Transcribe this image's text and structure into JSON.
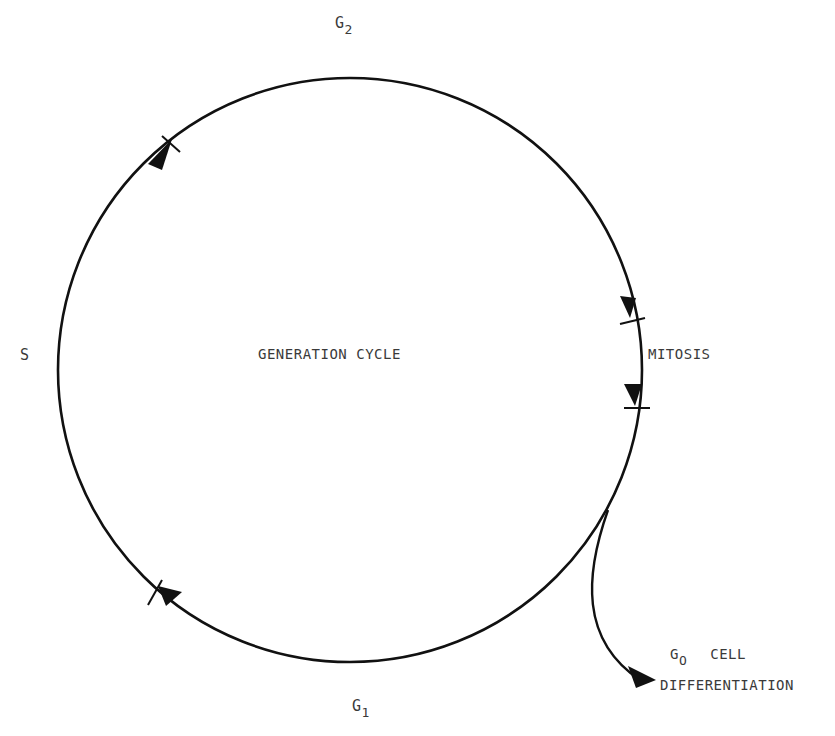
{
  "diagram": {
    "title": "GENERATION CYCLE",
    "phases": {
      "g2": {
        "base": "G",
        "sub": "2"
      },
      "s": {
        "label": "S"
      },
      "g1": {
        "base": "G",
        "sub": "1"
      },
      "mitosis": {
        "label": "MITOSIS"
      },
      "g0": {
        "base": "G",
        "sub": "O",
        "line1": "CELL",
        "line2": "DIFFERENTIATION"
      }
    },
    "colors": {
      "stroke": "#111111",
      "text": "#3a3a3a",
      "background": "#ffffff"
    }
  }
}
